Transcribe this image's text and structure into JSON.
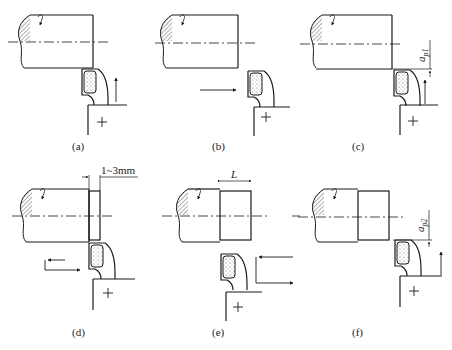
{
  "figure": {
    "panels": [
      {
        "id": "a",
        "caption": "(a)",
        "step": "tool approaches end face, feed upward",
        "feed_arrow": "up"
      },
      {
        "id": "b",
        "caption": "(b)",
        "step": "tool retracts horizontally",
        "feed_arrow": "right"
      },
      {
        "id": "c",
        "caption": "(c)",
        "step": "set depth of cut a_p1, feed upward",
        "feed_arrow": "up",
        "dimension_label": "a",
        "dimension_sub": "p1"
      },
      {
        "id": "d",
        "caption": "(d)",
        "step": "trial cut of 1~3mm then retract",
        "feed_arrow": "left-then-right",
        "dimension_label": "1~3mm"
      },
      {
        "id": "e",
        "caption": "(e)",
        "step": "measure length L",
        "feed_arrow": "left-then-right",
        "dimension_label": "L"
      },
      {
        "id": "f",
        "caption": "(f)",
        "step": "set depth of cut a_p2, feed upward",
        "feed_arrow": "up",
        "dimension_label": "a",
        "dimension_sub": "p2"
      }
    ]
  },
  "colors": {
    "line": "#1a1a1a",
    "background": "#ffffff"
  }
}
